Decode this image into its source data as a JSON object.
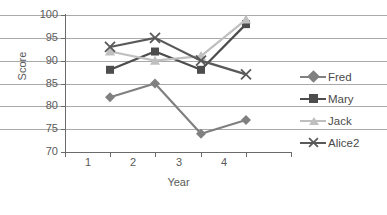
{
  "chart_data": {
    "type": "line",
    "title": "",
    "xlabel": "Year",
    "ylabel": "Score",
    "categories": [
      "1",
      "2",
      "3",
      "4"
    ],
    "x": [
      1,
      2,
      3,
      4
    ],
    "xlim": [
      0.5,
      4.5
    ],
    "ylim": [
      70,
      100
    ],
    "yticks": [
      70,
      75,
      80,
      85,
      90,
      95,
      100
    ],
    "grid": "horizontal",
    "legend_position": "right",
    "series": [
      {
        "name": "Fred",
        "values": [
          82,
          85,
          74,
          77
        ],
        "marker": "diamond",
        "color": "#808080"
      },
      {
        "name": "Mary",
        "values": [
          88,
          92,
          88,
          98
        ],
        "marker": "square",
        "color": "#4d4d4d"
      },
      {
        "name": "Jack",
        "values": [
          92,
          90,
          91,
          99
        ],
        "marker": "triangle",
        "color": "#bfbfbf"
      },
      {
        "name": "Alice2",
        "values": [
          93,
          95,
          90,
          87
        ],
        "marker": "x",
        "color": "#595959"
      }
    ]
  },
  "axes": {
    "y_tick_labels": [
      "100",
      "95",
      "90",
      "85",
      "80",
      "75",
      "70"
    ],
    "x_tick_labels": [
      "1",
      "2",
      "3",
      "4"
    ],
    "y_title": "Score",
    "x_title": "Year"
  },
  "legend": {
    "entries": [
      {
        "label": "Fred"
      },
      {
        "label": "Mary"
      },
      {
        "label": "Jack"
      },
      {
        "label": "Alice2"
      }
    ]
  },
  "colors": {
    "grid": "#a9a9a9",
    "axis": "#6b6b6b",
    "text": "#5a5a5a",
    "background": "#ffffff"
  }
}
